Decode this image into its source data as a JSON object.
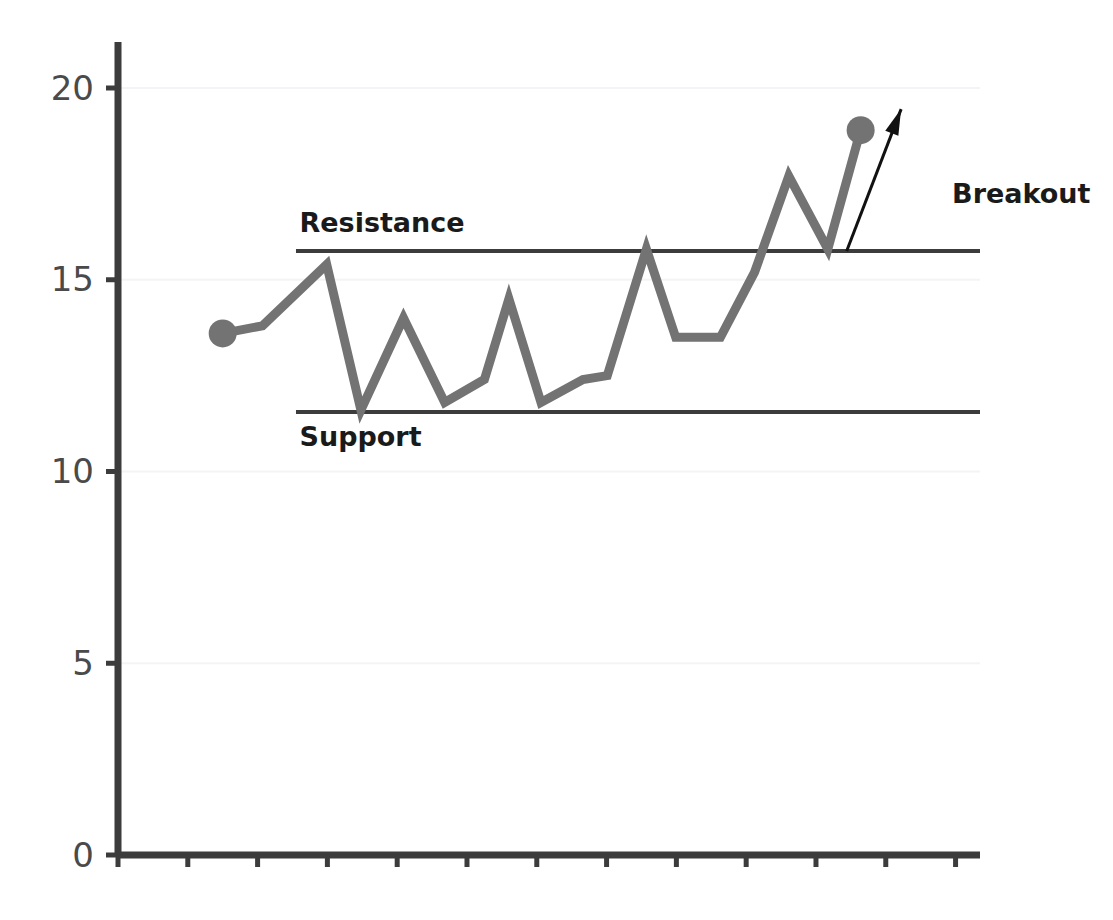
{
  "chart_data": {
    "type": "line",
    "title": "",
    "subtitle": "",
    "xlabel": "",
    "ylabel": "",
    "xlim": [
      0,
      13
    ],
    "ylim": [
      0,
      21.2
    ],
    "yticks": [
      0,
      5,
      10,
      15,
      20
    ],
    "ytick_labels": [
      "0",
      "5",
      "10",
      "15",
      "20"
    ],
    "xticks": [
      0,
      1,
      2,
      3,
      4,
      5,
      6,
      7,
      8,
      9,
      10,
      11,
      12
    ],
    "xtick_labels": [
      "",
      "",
      "",
      "",
      "",
      "",
      "",
      "",
      "",
      "",
      "",
      "",
      ""
    ],
    "grid": "faint-horizontal",
    "legend": "none",
    "series": [
      {
        "name": "price",
        "color": "#737373",
        "line_width": 9,
        "x": [
          1.5,
          2.07,
          2.99,
          3.48,
          4.09,
          4.68,
          5.25,
          5.6,
          6.06,
          6.66,
          7.01,
          7.57,
          7.99,
          8.63,
          9.12,
          9.61,
          10.17,
          10.64
        ],
        "values": [
          13.6,
          13.8,
          15.4,
          11.6,
          14.0,
          11.8,
          12.4,
          14.5,
          11.8,
          12.4,
          12.5,
          15.8,
          13.5,
          13.5,
          15.2,
          17.7,
          15.8,
          18.9
        ],
        "markers": [
          {
            "x": 1.5,
            "y": 13.6,
            "label": "start-point"
          },
          {
            "x": 10.64,
            "y": 18.9,
            "label": "breakout-point"
          }
        ]
      }
    ],
    "reference_lines": [
      {
        "name": "resistance",
        "label": "Resistance",
        "y": 15.75,
        "x_start": 2.55,
        "x_end": 12.35,
        "color": "#3c3c3c",
        "line_width": 4,
        "label_x": 2.6,
        "label_y": 16.45,
        "label_position": "above-left"
      },
      {
        "name": "support",
        "label": "Support",
        "y": 11.55,
        "x_start": 2.55,
        "x_end": 12.35,
        "color": "#3c3c3c",
        "line_width": 4,
        "label_x": 2.6,
        "label_y": 10.85,
        "label_position": "below-left"
      }
    ],
    "annotations": [
      {
        "name": "breakout",
        "text": "Breakout",
        "text_x": 11.95,
        "text_y": 17.2,
        "arrow": {
          "from_x": 10.44,
          "from_y": 15.75,
          "to_x": 11.22,
          "to_y": 19.45,
          "color": "#111111",
          "line_width": 3
        }
      }
    ],
    "axes": {
      "color": "#3c3c3c",
      "line_width": 7,
      "x_axis_y": 0,
      "y_axis_x": 0,
      "y_axis_top": 21.2,
      "x_axis_right": 12.35,
      "tick_color": "#3c3c3c",
      "tick_length": 12
    },
    "colors": {
      "background": "#ffffff",
      "line": "#737373",
      "reference": "#3c3c3c",
      "axis": "#3c3c3c",
      "tick_text": "#4a4a4a",
      "annotation_text": "#1a1a1a",
      "grid": "#f4f4f6"
    }
  }
}
